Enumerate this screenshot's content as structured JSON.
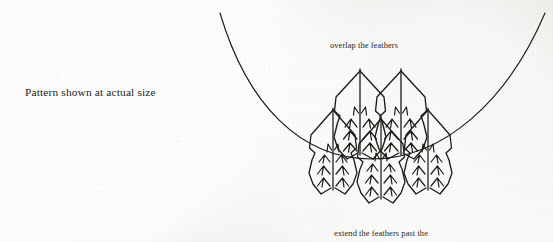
{
  "page": {
    "width": 553,
    "height": 242,
    "paper_color": "#f1efeb",
    "ink_color": "#1d1a18"
  },
  "captions": {
    "actual_size": "Pattern shown at actual size",
    "overlap": "overlap the feathers",
    "extend": "extend the feathers past the"
  },
  "diagram": {
    "name": "feather-pattern",
    "ink_color": "#1d1a18",
    "arc": {
      "name": "neckline-arc",
      "start_x": 220,
      "start_y": 13,
      "end_x": 545,
      "end_y": 13,
      "bottom_x": 372,
      "bottom_y": 159,
      "stroke_width": 1.1
    },
    "feathers": [
      {
        "id": "upper-left",
        "tip_x": 360,
        "tip_y": 71,
        "base_y": 153,
        "half_width": 25,
        "shoulder_y": 98,
        "scale": 1.0
      },
      {
        "id": "upper-right",
        "tip_x": 401,
        "tip_y": 71,
        "base_y": 153,
        "half_width": 25,
        "shoulder_y": 98,
        "scale": 1.0
      },
      {
        "id": "lower-left",
        "tip_x": 333,
        "tip_y": 110,
        "base_y": 192,
        "half_width": 24,
        "shoulder_y": 136,
        "scale": 0.95
      },
      {
        "id": "lower-center",
        "tip_x": 381,
        "tip_y": 118,
        "base_y": 200,
        "half_width": 24,
        "shoulder_y": 143,
        "scale": 0.95
      },
      {
        "id": "lower-right",
        "tip_x": 428,
        "tip_y": 110,
        "base_y": 192,
        "half_width": 24,
        "shoulder_y": 136,
        "scale": 0.95
      }
    ]
  }
}
